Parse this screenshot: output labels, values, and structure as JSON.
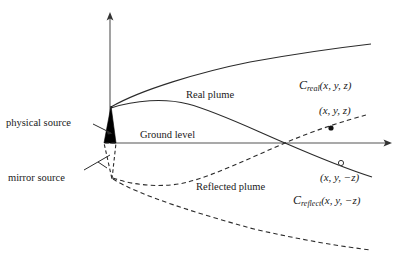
{
  "figure": {
    "width": 405,
    "height": 262,
    "background": "#ffffff",
    "ink": "#1a1a1a"
  },
  "axes": {
    "vertical_axis_name": "vertical-axis",
    "horizontal_axis_name": "horizontal-axis",
    "origin": {
      "x": 110,
      "y": 143
    },
    "vertical_tip": {
      "x": 110,
      "y": 13
    },
    "horizontal_tip": {
      "x": 392,
      "y": 143
    }
  },
  "labels": {
    "physical_source": "physical source",
    "mirror_source": "mirror source",
    "ground_level": "Ground level",
    "real_plume": "Real plume",
    "reflected_plume": "Reflected plume"
  },
  "math": {
    "c_real_symbol": "C",
    "c_real_subscript": "real",
    "c_real_args": "(x, y, z)",
    "point_real": "(x, y, z)",
    "point_reflect": "(x, y, −z)",
    "c_reflect_symbol": "C",
    "c_reflect_subscript": "reflect",
    "c_reflect_args": "(x, y, −z)"
  },
  "markers": {
    "real_point": {
      "x": 331,
      "y": 128,
      "style": "filled-dot"
    },
    "reflect_point": {
      "x": 341,
      "y": 163,
      "style": "open-circle"
    }
  },
  "stack": {
    "fill": "#000000",
    "apex": {
      "x": 111,
      "y": 106
    },
    "base_left": {
      "x": 104,
      "y": 143
    },
    "base_right": {
      "x": 116,
      "y": 143
    }
  },
  "mirror_stack": {
    "stroke_style": "dashed",
    "apex": {
      "x": 112,
      "y": 179
    },
    "base_left": {
      "x": 104,
      "y": 143
    },
    "base_right": {
      "x": 116,
      "y": 143
    }
  }
}
